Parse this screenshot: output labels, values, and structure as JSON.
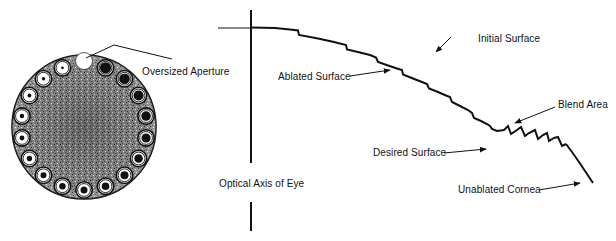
{
  "figure": {
    "left_panel": {
      "name": "aperture-wheel",
      "label_oversized": "Oversized Aperture",
      "aperture_count": 17,
      "colors": {
        "disk": "#6e6e6e",
        "ink": "#111111",
        "paper": "#ffffff"
      }
    },
    "right_panel": {
      "name": "corneal-ablation-profile",
      "labels": {
        "initial_surface": "Initial Surface",
        "ablated_surface": "Ablated Surface",
        "blend_area": "Blend Area",
        "desired_surface": "Desired Surface",
        "optical_axis": "Optical Axis of Eye",
        "unablated_cornea": "Unablated Cornea"
      }
    }
  }
}
